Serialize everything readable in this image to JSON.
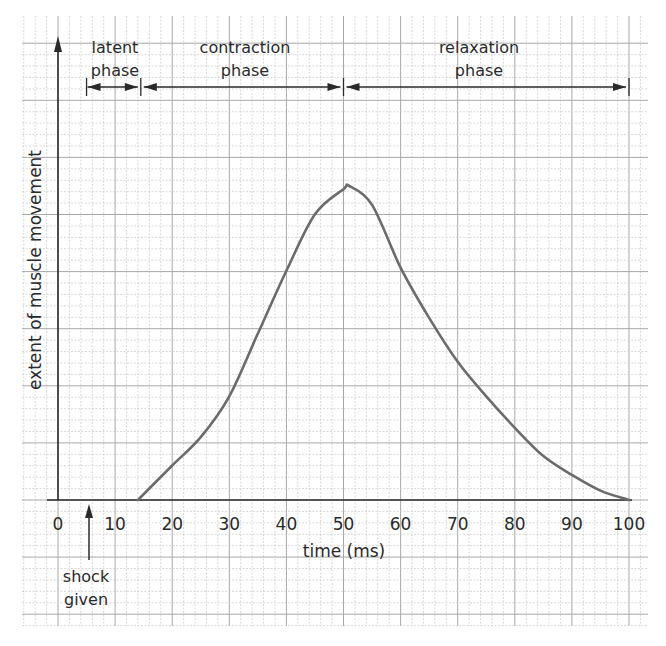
{
  "chart_data": {
    "type": "line",
    "title": "",
    "xlabel": "time (ms)",
    "ylabel": "extent of muscle movement",
    "xlim": [
      0,
      100
    ],
    "x_ticks": [
      "0",
      "10",
      "20",
      "30",
      "40",
      "50",
      "60",
      "70",
      "80",
      "90",
      "100"
    ],
    "y_ticks": [],
    "grid": true,
    "series": [
      {
        "name": "muscle twitch",
        "color": "#6b6b6b",
        "x": [
          14,
          20,
          25,
          30,
          35,
          40,
          45,
          50,
          51,
          55,
          60,
          65,
          70,
          75,
          80,
          85,
          90,
          95,
          100
        ],
        "y": [
          0,
          11,
          20,
          33,
          53,
          73,
          91,
          99,
          100,
          94,
          74,
          58,
          44,
          33,
          23,
          14,
          8,
          3,
          0
        ]
      }
    ],
    "annotations": [
      {
        "id": "latent",
        "text_line1": "latent",
        "text_line2": "phase",
        "from": 5,
        "to": 14.5
      },
      {
        "id": "contraction",
        "text_line1": "contraction",
        "text_line2": "phase",
        "from": 14.5,
        "to": 50
      },
      {
        "id": "relaxation",
        "text_line1": "relaxation",
        "text_line2": "phase",
        "from": 50,
        "to": 100
      },
      {
        "id": "shock",
        "text_line1": "shock",
        "text_line2": "given",
        "at": 5
      }
    ]
  },
  "labels": {
    "xlabel": "time (ms)",
    "ylabel": "extent of muscle movement",
    "latent_1": "latent",
    "latent_2": "phase",
    "contraction_1": "contraction",
    "contraction_2": "phase",
    "relaxation_1": "relaxation",
    "relaxation_2": "phase",
    "shock_1": "shock",
    "shock_2": "given",
    "ticks": [
      "0",
      "10",
      "20",
      "30",
      "40",
      "50",
      "60",
      "70",
      "80",
      "90",
      "100"
    ]
  },
  "colors": {
    "grid_minor": "#c9c9c9",
    "grid_major": "#a8a8a8",
    "axis": "#2a2a2a",
    "curve": "#6b6b6b"
  }
}
